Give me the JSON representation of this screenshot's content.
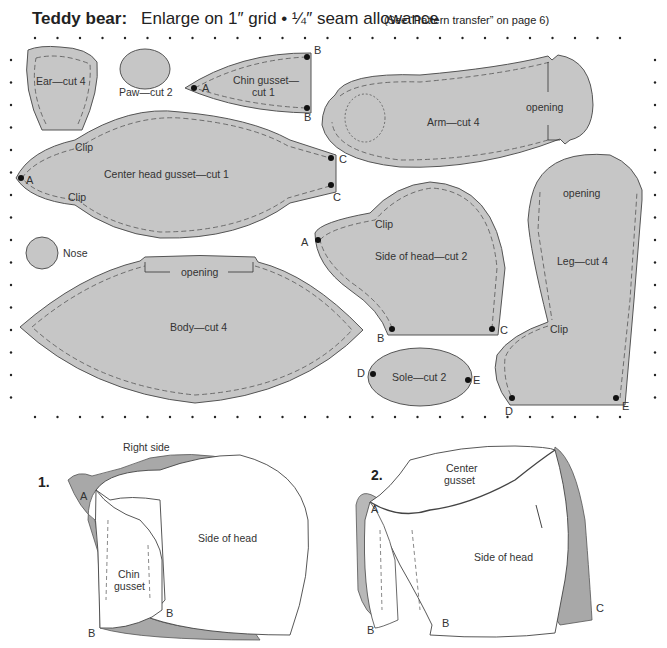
{
  "header": {
    "title": "Teddy bear:",
    "subtitle": "Enlarge on 1″ grid  •  ¼″ seam allowance",
    "note": "(See “Pattern transfer” on page 6)"
  },
  "pieces": {
    "ear": "Ear—cut 4",
    "paw": "Paw—cut 2",
    "chin_gusset_1": "Chin gusset—",
    "chin_gusset_2": "cut 1",
    "arm": "Arm—cut 4",
    "center_head_gusset": "Center head gusset—cut 1",
    "nose": "Nose",
    "body": "Body—cut 4",
    "side_of_head": "Side of head—cut 2",
    "leg": "Leg—cut 4",
    "sole": "Sole—cut 2"
  },
  "marks": {
    "opening": "opening",
    "clip": "Clip",
    "A": "A",
    "B": "B",
    "C": "C",
    "D": "D",
    "E": "E"
  },
  "steps": {
    "step1": {
      "number": "1.",
      "right_side": "Right side",
      "chin1": "Chin",
      "chin2": "gusset",
      "side_of_head": "Side of head"
    },
    "step2": {
      "number": "2.",
      "center1": "Center",
      "center2": "gusset",
      "side_of_head": "Side of head"
    }
  },
  "colors": {
    "piece_fill": "#c6c6c6",
    "outline": "#555555",
    "fur": "#9a9a9a"
  }
}
